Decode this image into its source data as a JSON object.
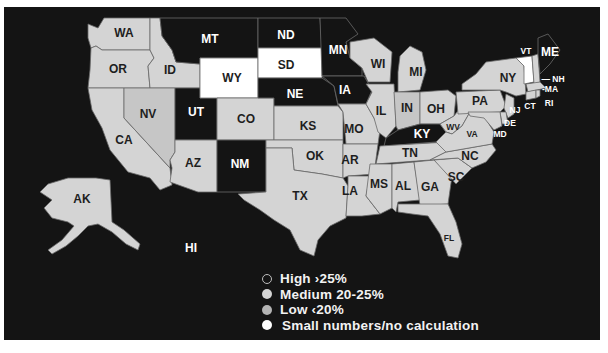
{
  "map": {
    "colors": {
      "background": "#141414",
      "high": "#141414",
      "medium": "#d4d4d4",
      "low": "#c6c6c6",
      "small": "#ffffff",
      "label_dark": "#1e1e1e",
      "label_light": "#ffffff"
    },
    "states": [
      {
        "abbr": "WA",
        "category": "medium"
      },
      {
        "abbr": "OR",
        "category": "medium"
      },
      {
        "abbr": "ID",
        "category": "medium"
      },
      {
        "abbr": "MT",
        "category": "high"
      },
      {
        "abbr": "ND",
        "category": "high"
      },
      {
        "abbr": "SD",
        "category": "small"
      },
      {
        "abbr": "WY",
        "category": "small"
      },
      {
        "abbr": "MN",
        "category": "high"
      },
      {
        "abbr": "NE",
        "category": "high"
      },
      {
        "abbr": "IA",
        "category": "high"
      },
      {
        "abbr": "WI",
        "category": "medium"
      },
      {
        "abbr": "MI",
        "category": "medium"
      },
      {
        "abbr": "NV",
        "category": "low"
      },
      {
        "abbr": "UT",
        "category": "high"
      },
      {
        "abbr": "CO",
        "category": "medium"
      },
      {
        "abbr": "KS",
        "category": "medium"
      },
      {
        "abbr": "MO",
        "category": "medium"
      },
      {
        "abbr": "IL",
        "category": "medium"
      },
      {
        "abbr": "IN",
        "category": "low"
      },
      {
        "abbr": "OH",
        "category": "medium"
      },
      {
        "abbr": "PA",
        "category": "medium"
      },
      {
        "abbr": "NY",
        "category": "medium"
      },
      {
        "abbr": "VT",
        "category": "small"
      },
      {
        "abbr": "ME",
        "category": "high"
      },
      {
        "abbr": "NH",
        "category": "medium"
      },
      {
        "abbr": "MA",
        "category": "medium"
      },
      {
        "abbr": "RI",
        "category": "medium"
      },
      {
        "abbr": "CT",
        "category": "medium"
      },
      {
        "abbr": "NJ",
        "category": "medium"
      },
      {
        "abbr": "DE",
        "category": "medium"
      },
      {
        "abbr": "MD",
        "category": "medium"
      },
      {
        "abbr": "CA",
        "category": "medium"
      },
      {
        "abbr": "AZ",
        "category": "medium"
      },
      {
        "abbr": "NM",
        "category": "high"
      },
      {
        "abbr": "OK",
        "category": "medium"
      },
      {
        "abbr": "TX",
        "category": "medium"
      },
      {
        "abbr": "AR",
        "category": "medium"
      },
      {
        "abbr": "LA",
        "category": "medium"
      },
      {
        "abbr": "KY",
        "category": "high"
      },
      {
        "abbr": "WV",
        "category": "medium"
      },
      {
        "abbr": "VA",
        "category": "medium"
      },
      {
        "abbr": "TN",
        "category": "medium"
      },
      {
        "abbr": "NC",
        "category": "medium"
      },
      {
        "abbr": "SC",
        "category": "medium"
      },
      {
        "abbr": "MS",
        "category": "medium"
      },
      {
        "abbr": "AL",
        "category": "medium"
      },
      {
        "abbr": "GA",
        "category": "medium"
      },
      {
        "abbr": "FL",
        "category": "medium"
      },
      {
        "abbr": "AK",
        "category": "medium"
      },
      {
        "abbr": "HI",
        "category": "high"
      }
    ]
  },
  "legend": {
    "items": [
      {
        "label": "High ›25%",
        "category": "high"
      },
      {
        "label": "Medium 20-25%",
        "category": "medium"
      },
      {
        "label": "Low ‹20%",
        "category": "low"
      },
      {
        "label": "Small numbers/no calculation",
        "category": "small"
      }
    ]
  }
}
